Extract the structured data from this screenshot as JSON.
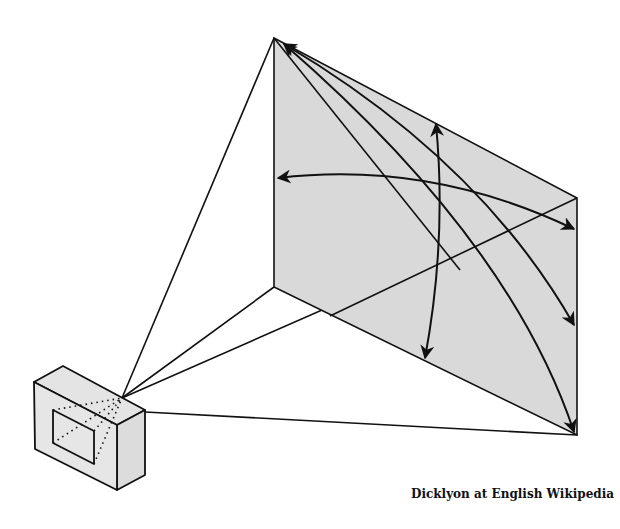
{
  "diagram": {
    "colors": {
      "background": "#ffffff",
      "screen_fill": "#d9d9d9",
      "camera_fill": "#e2e2e2",
      "line": "#111111"
    },
    "screen": {
      "tl": [
        274,
        38
      ],
      "tr": [
        577,
        198
      ],
      "br": [
        577,
        435
      ],
      "bl": [
        274,
        287
      ]
    },
    "lens_point": [
      122,
      398
    ],
    "arrows": [
      {
        "name": "horizontal-angle",
        "from": [
          574,
          229
        ],
        "to": [
          278,
          178
        ]
      },
      {
        "name": "vertical-angle",
        "from": [
          436,
          124
        ],
        "to": [
          425,
          358
        ]
      },
      {
        "name": "diagonal-angle-1",
        "from": [
          284,
          44
        ],
        "to": [
          574,
          325
        ]
      },
      {
        "name": "diagonal-angle-2",
        "from": [
          284,
          44
        ],
        "to": [
          574,
          432
        ]
      }
    ]
  },
  "credit": "Dicklyon at English Wikipedia"
}
